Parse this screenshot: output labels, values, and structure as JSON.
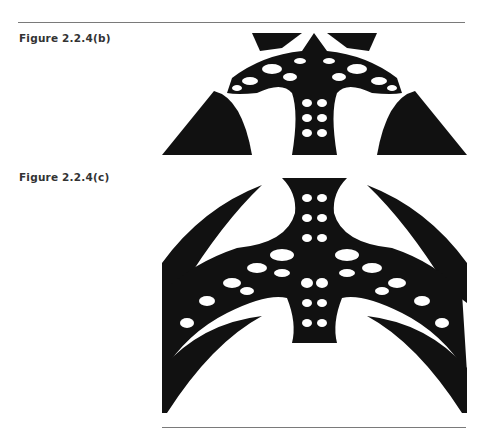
{
  "page": {
    "figures": [
      {
        "caption": "Figure  2.2.4(b)",
        "image": "fractal-image"
      },
      {
        "caption": "Figure  2.2.4(c)",
        "image": "fractal-image"
      }
    ]
  },
  "colors": {
    "ink": "#111111",
    "rule": "#7a7a7a",
    "caption": "#333333"
  }
}
